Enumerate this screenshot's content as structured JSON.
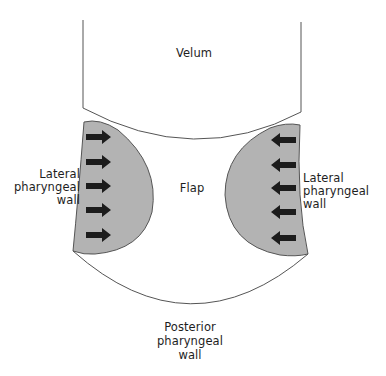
{
  "diagram": {
    "type": "anatomical-schematic",
    "colors": {
      "background": "#ffffff",
      "outline": "#555555",
      "wall_fill": "#b3b3b3",
      "arrow_fill": "#1c1c1c",
      "text": "#1e1e1e"
    },
    "labels": {
      "velum": "Velum",
      "flap": "Flap",
      "left_wall_line1": "Lateral",
      "left_wall_line2": "pharyngeal",
      "left_wall_line3": "wall",
      "right_wall_line1": "Lateral",
      "right_wall_line2": "pharyngeal",
      "right_wall_line3": "wall",
      "posterior_line1": "Posterior",
      "posterior_line2": "pharyngeal",
      "posterior_line3": "wall"
    },
    "arrows": {
      "left": {
        "direction": "right",
        "count": 5
      },
      "right": {
        "direction": "left",
        "count": 5
      }
    }
  }
}
